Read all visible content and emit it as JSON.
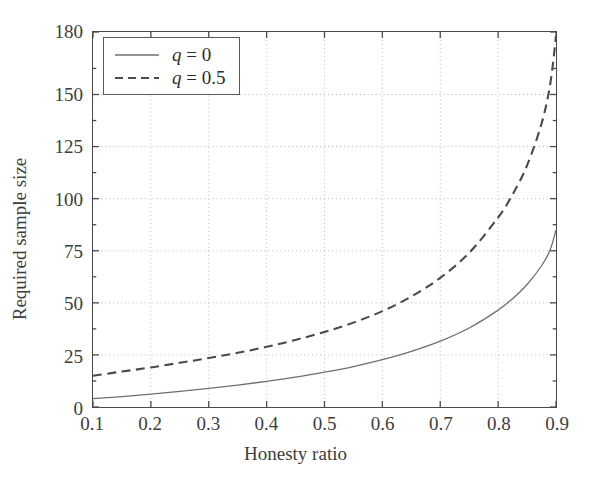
{
  "chart_data": {
    "type": "line",
    "title": "",
    "xlabel": "Honesty ratio",
    "ylabel": "Required sample size",
    "xlim": [
      0.1,
      0.9
    ],
    "ylim": [
      0,
      180
    ],
    "xticks": [
      "0.1",
      "0.2",
      "0.3",
      "0.4",
      "0.5",
      "0.6",
      "0.7",
      "0.8",
      "0.9"
    ],
    "xtick_values": [
      0.1,
      0.2,
      0.3,
      0.4,
      0.5,
      0.6,
      0.7,
      0.8,
      0.9
    ],
    "yticks": [
      "0",
      "25",
      "50",
      "75",
      "100",
      "125",
      "150",
      "180"
    ],
    "ytick_values": [
      0,
      25,
      50,
      75,
      100,
      125,
      150,
      180
    ],
    "grid": true,
    "grid_style": "dotted",
    "legend_position": "upper left",
    "x": [
      0.1,
      0.15,
      0.2,
      0.25,
      0.3,
      0.35,
      0.4,
      0.45,
      0.5,
      0.55,
      0.6,
      0.65,
      0.7,
      0.75,
      0.8,
      0.825,
      0.85,
      0.875,
      0.89,
      0.9
    ],
    "series": [
      {
        "name": "q = 0",
        "label_symbol": "q",
        "label_value": "0",
        "style": "solid",
        "color": "#6f6f6f",
        "values": [
          4.0,
          5.0,
          6.2,
          7.5,
          8.9,
          10.5,
          12.3,
          14.3,
          16.7,
          19.4,
          22.7,
          26.7,
          31.6,
          37.9,
          46.5,
          52.0,
          58.8,
          67.8,
          75.5,
          85.0
        ]
      },
      {
        "name": "q = 0.5",
        "label_symbol": "q",
        "label_value": "0.5",
        "style": "dashed",
        "color": "#4a4a4a",
        "values": [
          15.0,
          17.0,
          19.0,
          21.2,
          23.5,
          26.0,
          28.9,
          32.2,
          36.0,
          40.5,
          46.0,
          53.0,
          62.0,
          74.0,
          91.0,
          102.0,
          116.0,
          136.0,
          155.0,
          178.0
        ]
      }
    ]
  },
  "legend": {
    "entries": [
      {
        "text": "q = 0",
        "symbol": "q",
        "rest": " = 0",
        "style": "solid"
      },
      {
        "text": "q = 0.5",
        "symbol": "q",
        "rest": " = 0.5",
        "style": "dashed"
      }
    ]
  },
  "colors": {
    "axis": "#4a4a4a",
    "grid": "#b9b9b9",
    "solid_series": "#6f6f6f",
    "dashed_series": "#4a4a4a",
    "text": "#3d3d3d",
    "background": "#ffffff"
  }
}
